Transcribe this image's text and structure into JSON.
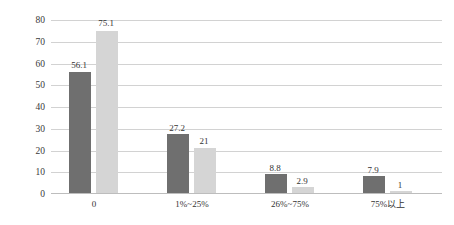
{
  "chart_data": {
    "type": "bar",
    "title": "",
    "xlabel": "",
    "ylabel": "比例(%)",
    "ylim": [
      0,
      80
    ],
    "yticks": [
      0,
      10,
      20,
      30,
      40,
      50,
      60,
      70,
      80
    ],
    "ytick_labels": [
      "0",
      "10",
      "20",
      "30",
      "40",
      "50",
      "60",
      "70",
      "80"
    ],
    "grid": true,
    "legend": "none",
    "categories": [
      "0",
      "1%~25%",
      "26%~75%",
      "75%以上"
    ],
    "series": [
      {
        "name": "series-1",
        "color": "#6f6f6f",
        "values": [
          56.1,
          27.2,
          8.8,
          7.9
        ],
        "labels": [
          "56.1",
          "27.2",
          "8.8",
          "7.9"
        ]
      },
      {
        "name": "series-2",
        "color": "#d5d5d5",
        "values": [
          75.1,
          21,
          2.9,
          1
        ],
        "labels": [
          "75.1",
          "21",
          "2.9",
          "1"
        ]
      }
    ]
  },
  "axis": {
    "y_title": "比例(%)",
    "y_ticks": [
      "80",
      "70",
      "60",
      "50",
      "40",
      "30",
      "20",
      "10",
      "0"
    ],
    "x_ticks": [
      "0",
      "1%~25%",
      "26%~75%",
      "75%以上"
    ]
  },
  "values": {
    "g0s0": "56.1",
    "g0s1": "75.1",
    "g1s0": "27.2",
    "g1s1": "21",
    "g2s0": "8.8",
    "g2s1": "2.9",
    "g3s0": "7.9",
    "g3s1": "1"
  },
  "colors": {
    "series1": "#6f6f6f",
    "series2": "#d5d5d5",
    "gridline": "#d2d2d2",
    "text": "#333333",
    "background": "#ffffff"
  }
}
